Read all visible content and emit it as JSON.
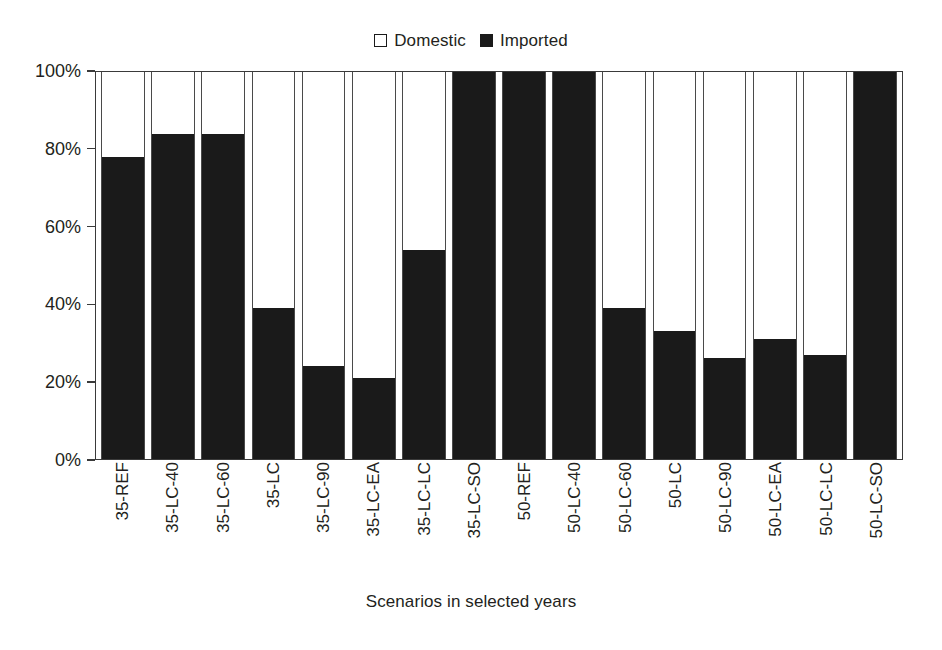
{
  "chart_data": {
    "type": "bar",
    "subtype": "stacked-percent",
    "title": "",
    "xlabel": "Scenarios in selected years",
    "ylabel": "",
    "ylim": [
      0,
      100
    ],
    "yticks": [
      "0%",
      "20%",
      "40%",
      "60%",
      "80%",
      "100%"
    ],
    "ytick_values": [
      0,
      20,
      40,
      60,
      80,
      100
    ],
    "grid": false,
    "legend_position": "top-center",
    "categories": [
      "35-REF",
      "35-LC-40",
      "35-LC-60",
      "35-LC",
      "35-LC-90",
      "35-LC-EA",
      "35-LC-LC",
      "35-LC-SO",
      "50-REF",
      "50-LC-40",
      "50-LC-60",
      "50-LC",
      "50-LC-90",
      "50-LC-EA",
      "50-LC-LC",
      "50-LC-SO"
    ],
    "series": [
      {
        "name": "Imported",
        "color": "#1a1a1a",
        "values": [
          78,
          84,
          84,
          39,
          24,
          21,
          54,
          100,
          100,
          100,
          39,
          33,
          26,
          31,
          27,
          100
        ]
      },
      {
        "name": "Domestic",
        "color": "#ffffff",
        "values": [
          22,
          16,
          16,
          61,
          76,
          79,
          46,
          0,
          0,
          0,
          61,
          67,
          74,
          69,
          73,
          0
        ]
      }
    ]
  },
  "legend": {
    "entries": [
      {
        "label": "Domestic",
        "swatch": "white-square-outline"
      },
      {
        "label": "Imported",
        "swatch": "black-square-filled"
      }
    ]
  },
  "axes": {
    "x_title": "Scenarios in selected years"
  },
  "colors": {
    "imported": "#1a1a1a",
    "domestic": "#ffffff",
    "axis": "#3a3a3a",
    "text": "#231f20",
    "background": "#ffffff"
  }
}
